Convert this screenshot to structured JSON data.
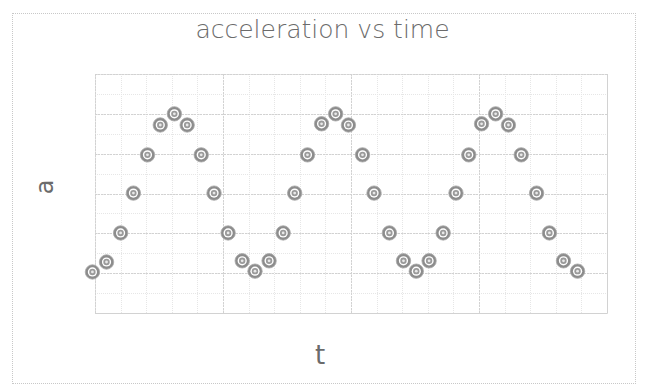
{
  "chart_data": {
    "type": "scatter",
    "title": "acceleration vs time",
    "xlabel": "t",
    "ylabel": "a",
    "xlim": [
      0,
      4
    ],
    "ylim": [
      0,
      6
    ],
    "grid": {
      "major": true,
      "minor": true,
      "x_major_step": 1,
      "x_minor_per_major": 5,
      "y_major_step": 1,
      "y_minor_per_major": 2
    },
    "tick_labels_visible": false,
    "legend": null,
    "marker": {
      "shape": "bullseye-circle",
      "color": "#8c8c8c"
    },
    "series": [
      {
        "name": "a",
        "x": [
          -0.02,
          0.09,
          0.2,
          0.3,
          0.41,
          0.51,
          0.62,
          0.72,
          0.83,
          0.93,
          1.04,
          1.15,
          1.25,
          1.36,
          1.47,
          1.56,
          1.66,
          1.77,
          1.88,
          1.98,
          2.09,
          2.18,
          2.3,
          2.41,
          2.51,
          2.61,
          2.72,
          2.82,
          2.92,
          3.02,
          3.13,
          3.23,
          3.33,
          3.45,
          3.55,
          3.66,
          3.77
        ],
        "y": [
          1.03,
          1.28,
          2.01,
          3.01,
          3.97,
          4.72,
          5.0,
          4.72,
          3.97,
          3.01,
          2.01,
          1.31,
          1.05,
          1.31,
          2.01,
          3.01,
          3.97,
          4.75,
          5.0,
          4.72,
          3.97,
          3.01,
          2.01,
          1.31,
          1.05,
          1.31,
          2.01,
          3.01,
          3.97,
          4.75,
          5.0,
          4.72,
          3.97,
          3.01,
          2.01,
          1.31,
          1.05
        ]
      }
    ]
  },
  "layout": {
    "plot_left": 95,
    "plot_top": 74,
    "plot_right": 607,
    "plot_bottom": 313,
    "colors": {
      "gridline": "#d2d2d2",
      "minor_gridline": "#e6e6e6",
      "marker": "#8c8c8c",
      "text": "#6b6b6b"
    }
  }
}
